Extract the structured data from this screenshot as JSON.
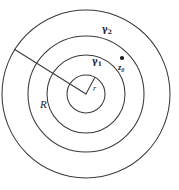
{
  "figure": {
    "type": "geometric-diagram",
    "background_color": "#ffffff",
    "stroke_color": "#3a3a3a",
    "width": 179,
    "height": 190,
    "center": {
      "x": 86,
      "y": 94
    },
    "circles": [
      {
        "name": "innermost-circle",
        "radius": 19
      },
      {
        "name": "gamma1-circle",
        "radius": 39
      },
      {
        "name": "gamma2-circle",
        "radius": 58
      },
      {
        "name": "outermost-circle",
        "radius": 84
      }
    ],
    "radii": [
      {
        "name": "small-radius",
        "label": "r",
        "angle_deg": -62,
        "length": 19
      },
      {
        "name": "large-radius",
        "label": "R",
        "angle_deg": 212,
        "length": 84
      }
    ],
    "point": {
      "name": "z0",
      "label": "z",
      "subscript": "0",
      "x": 122,
      "y": 58,
      "color": "#1a1a1a"
    },
    "labels": {
      "gamma2": {
        "text": "γ",
        "subscript": "2",
        "x": 104,
        "y": 29
      },
      "gamma1": {
        "text": "γ",
        "subscript": "1",
        "x": 93,
        "y": 60
      },
      "big_r": {
        "text": "R",
        "x": 42,
        "y": 104
      },
      "small_r": {
        "text": "r",
        "x": 94,
        "y": 89
      }
    }
  }
}
